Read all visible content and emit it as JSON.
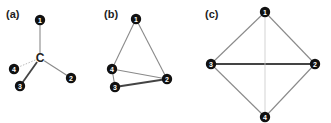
{
  "panels": [
    {
      "label": "(a)",
      "center_atom": "C",
      "nodes": [
        {
          "id": "1",
          "x": 40,
          "y": 20
        },
        {
          "id": "2",
          "x": 71,
          "y": 78
        },
        {
          "id": "3",
          "x": 20,
          "y": 86
        },
        {
          "id": "4",
          "x": 14,
          "y": 69
        }
      ],
      "edges": [
        {
          "from": "C",
          "to": "1",
          "style": "medium"
        },
        {
          "from": "C",
          "to": "2",
          "style": "medium"
        },
        {
          "from": "C",
          "to": "3",
          "style": "bold"
        },
        {
          "from": "C",
          "to": "4",
          "style": "dotted"
        }
      ]
    },
    {
      "label": "(b)",
      "nodes": [
        {
          "id": "1",
          "x": 136,
          "y": 19
        },
        {
          "id": "2",
          "x": 167,
          "y": 79
        },
        {
          "id": "3",
          "x": 115,
          "y": 87
        },
        {
          "id": "4",
          "x": 112,
          "y": 69
        }
      ],
      "edges": [
        {
          "from": "1",
          "to": "4",
          "style": "medium"
        },
        {
          "from": "1",
          "to": "2",
          "style": "medium"
        },
        {
          "from": "4",
          "to": "2",
          "style": "medium"
        },
        {
          "from": "3",
          "to": "2",
          "style": "bold"
        },
        {
          "from": "4",
          "to": "3",
          "style": "medium"
        }
      ]
    },
    {
      "label": "(c)",
      "nodes": [
        {
          "id": "1",
          "x": 265,
          "y": 12
        },
        {
          "id": "2",
          "x": 315,
          "y": 64
        },
        {
          "id": "3",
          "x": 211,
          "y": 64
        },
        {
          "id": "4",
          "x": 265,
          "y": 117
        }
      ],
      "edges": [
        {
          "from": "1",
          "to": "3",
          "style": "medium"
        },
        {
          "from": "1",
          "to": "2",
          "style": "medium"
        },
        {
          "from": "3",
          "to": "4",
          "style": "medium"
        },
        {
          "from": "2",
          "to": "4",
          "style": "medium"
        },
        {
          "from": "3",
          "to": "2",
          "style": "bold"
        },
        {
          "from": "1",
          "to": "4",
          "style": "thin"
        }
      ]
    }
  ],
  "colors": {
    "node_fill": "#111111",
    "node_text": "#ffffff",
    "edge_medium": "#8a8a8a",
    "edge_bold": "#444444",
    "edge_thin": "#c8c8c8",
    "edge_dotted": "#bbbbbb"
  }
}
